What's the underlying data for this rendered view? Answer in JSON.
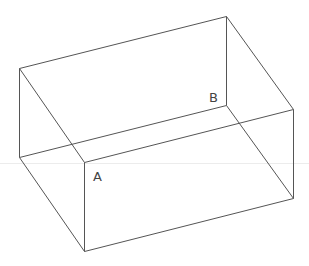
{
  "figure": {
    "type": "3D wireframe rectangular box (cuboid)",
    "colors": {
      "edge": "#555555",
      "guide": "#ececec",
      "label": "#444444",
      "background": "#ffffff"
    },
    "labels": {
      "A": "A",
      "B": "B"
    },
    "vertices": [
      {
        "id": "top-back-left"
      },
      {
        "id": "top-back-right"
      },
      {
        "id": "top-front-right"
      },
      {
        "id": "top-front-left"
      },
      {
        "id": "bottom-back-left"
      },
      {
        "id": "bottom-back-right",
        "label": "B"
      },
      {
        "id": "bottom-front-right"
      },
      {
        "id": "bottom-front-left",
        "label": "A"
      }
    ],
    "edges": [
      {
        "name": "edge-top-back",
        "from": "top-back-left",
        "to": "top-back-right"
      },
      {
        "name": "edge-top-right",
        "from": "top-back-right",
        "to": "top-front-right"
      },
      {
        "name": "edge-top-front",
        "from": "top-front-right",
        "to": "top-front-left"
      },
      {
        "name": "edge-top-left",
        "from": "top-front-left",
        "to": "top-back-left"
      },
      {
        "name": "edge-vertical-back-left",
        "from": "top-back-left",
        "to": "bottom-back-left"
      },
      {
        "name": "edge-vertical-back-right",
        "from": "top-back-right",
        "to": "bottom-back-right"
      },
      {
        "name": "edge-vertical-front-right",
        "from": "top-front-right",
        "to": "bottom-front-right"
      },
      {
        "name": "edge-vertical-front-left",
        "from": "top-front-left",
        "to": "bottom-front-left"
      },
      {
        "name": "edge-bottom-back",
        "from": "bottom-back-left",
        "to": "bottom-back-right"
      },
      {
        "name": "edge-bottom-right",
        "from": "bottom-back-right",
        "to": "bottom-front-right"
      },
      {
        "name": "edge-bottom-front",
        "from": "bottom-front-right",
        "to": "bottom-front-left"
      },
      {
        "name": "edge-bottom-left",
        "from": "bottom-front-left",
        "to": "bottom-back-left"
      }
    ]
  }
}
